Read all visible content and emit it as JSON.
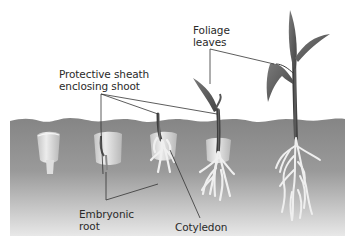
{
  "diagram": {
    "type": "seedling germination stages (monocot / maize)",
    "stages": 5,
    "labels": {
      "foliage": {
        "line1": "Foliage",
        "line2": "leaves"
      },
      "sheath": {
        "line1": "Protective sheath",
        "line2": "enclosing shoot"
      },
      "embryonic_root": {
        "line1": "Embryonic",
        "line2": "root"
      },
      "cotyledon": {
        "line1": "Cotyledon"
      }
    },
    "colors": {
      "background": "#ffffff",
      "soil_top": "#8a8a8a",
      "soil_bottom": "#e6e6e6",
      "seed": "#dcdcdc",
      "plant": "#5a5a5a",
      "root": "#ececec",
      "leader_line": "#333333",
      "text": "#2a2a2a"
    }
  }
}
